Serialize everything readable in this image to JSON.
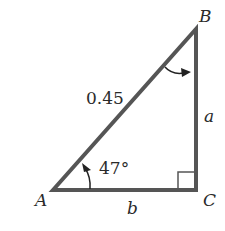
{
  "diagram": {
    "type": "right-triangle",
    "vertices": {
      "A": {
        "label": "A"
      },
      "B": {
        "label": "B"
      },
      "C": {
        "label": "C"
      }
    },
    "sides": {
      "hypotenuse": {
        "label": "0.45"
      },
      "BC": {
        "label": "a"
      },
      "AC": {
        "label": "b"
      }
    },
    "angles": {
      "A": {
        "label": "47°"
      },
      "C": {
        "right_angle": true
      }
    },
    "colors": {
      "line": "#555555",
      "text": "#2a2a2a",
      "background": "#ffffff"
    }
  }
}
